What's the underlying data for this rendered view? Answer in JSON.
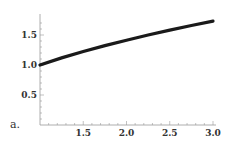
{
  "panel_label": "a.",
  "chart_data": {
    "type": "line",
    "title": "",
    "xlabel": "",
    "ylabel": "",
    "xlim": [
      1.0,
      3.0
    ],
    "ylim": [
      0.0,
      1.8
    ],
    "grid": false,
    "legend": null,
    "x_ticks": [
      "1.5",
      "2.0",
      "2.5",
      "3.0"
    ],
    "y_ticks": [
      "0.5",
      "1.0",
      "1.5"
    ],
    "series": [
      {
        "name": "curve",
        "color": "#1a1a1a",
        "x": [
          1.0,
          1.25,
          1.5,
          1.75,
          2.0,
          2.25,
          2.5,
          2.75,
          3.0
        ],
        "y": [
          1.0,
          1.118,
          1.225,
          1.323,
          1.414,
          1.5,
          1.581,
          1.658,
          1.732
        ]
      }
    ]
  }
}
